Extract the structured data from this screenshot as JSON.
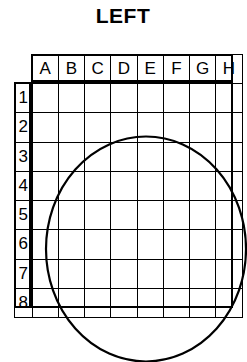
{
  "title": "LEFT",
  "grid": {
    "column_headers": [
      "A",
      "B",
      "C",
      "D",
      "E",
      "F",
      "G",
      "H"
    ],
    "row_headers": [
      "1",
      "2",
      "3",
      "4",
      "5",
      "6",
      "7",
      "8"
    ],
    "corner_label": "",
    "columns": 8,
    "rows": 8,
    "cell_values": [
      [
        "",
        "",
        "",
        "",
        "",
        "",
        "",
        ""
      ],
      [
        "",
        "",
        "",
        "",
        "",
        "",
        "",
        ""
      ],
      [
        "",
        "",
        "",
        "",
        "",
        "",
        "",
        ""
      ],
      [
        "",
        "",
        "",
        "",
        "",
        "",
        "",
        ""
      ],
      [
        "",
        "",
        "",
        "",
        "",
        "",
        "",
        ""
      ],
      [
        "",
        "",
        "",
        "",
        "",
        "",
        "",
        ""
      ],
      [
        "",
        "",
        "",
        "",
        "",
        "",
        "",
        ""
      ],
      [
        "",
        "",
        "",
        "",
        "",
        "",
        "",
        ""
      ]
    ],
    "line_color": "#000000",
    "background_color": "#ffffff"
  },
  "shape": {
    "name": "ellipse",
    "stroke_color": "#000000",
    "stroke_width": 2.2,
    "fill": "none",
    "center_col_span": "A-H",
    "center_row_span": "1-8",
    "bounds_note": "spans full 8x8 body: left edge of column A to right edge of column H, top of row 1 to bottom of row 8"
  }
}
